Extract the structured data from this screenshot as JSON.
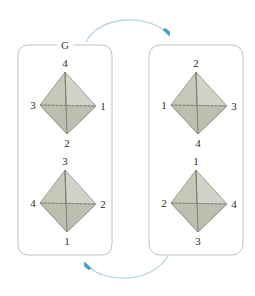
{
  "figure": {
    "title_label": "G",
    "colors": {
      "tetra_fill": "#c6c8ba",
      "tetra_fill_light": "#d2d3c8",
      "tetra_fill_dark": "#bcbfb0",
      "tetra_edge": "#6f7265",
      "box_stroke": "#b9b9b9",
      "arrow_line": "#bcd5e4",
      "arrow_head": "#4a9ecd",
      "label_text": "#2b2b2b",
      "background": "#ffffff"
    }
  },
  "boxes": [
    {
      "name": "left-coset-box",
      "label": "G",
      "tetrahedra": [
        {
          "name": "tetrahedron-1",
          "top": "4",
          "left": "3",
          "right": "1",
          "bottom": "2"
        },
        {
          "name": "tetrahedron-2",
          "top": "3",
          "left": "4",
          "right": "2",
          "bottom": "1"
        }
      ]
    },
    {
      "name": "right-coset-box",
      "label": "",
      "tetrahedra": [
        {
          "name": "tetrahedron-3",
          "top": "2",
          "left": "1",
          "right": "3",
          "bottom": "4"
        },
        {
          "name": "tetrahedron-4",
          "top": "1",
          "left": "2",
          "right": "4",
          "bottom": "3"
        }
      ]
    }
  ],
  "arrows": [
    {
      "name": "top-arrow",
      "direction": "left-to-right",
      "label": ""
    },
    {
      "name": "bottom-arrow",
      "direction": "right-to-left",
      "label": ""
    }
  ]
}
